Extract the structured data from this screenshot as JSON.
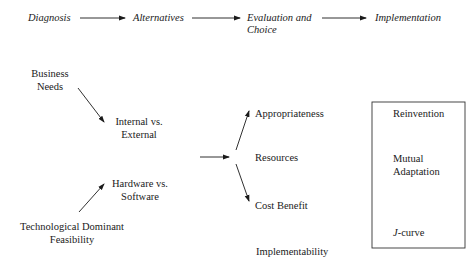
{
  "process_stages": [
    {
      "label": "Diagnosis"
    },
    {
      "label": "Alternatives"
    },
    {
      "label_line1": "Evaluation and",
      "label_line2": "Choice"
    },
    {
      "label": "Implementation"
    }
  ],
  "alternatives": {
    "business_needs": {
      "line1": "Business",
      "line2": "Needs"
    },
    "internal_external": {
      "line1": "Internal vs.",
      "line2": "External"
    },
    "hardware_software": {
      "line1": "Hardware vs.",
      "line2": "Software"
    },
    "tech_feasibility": {
      "line1": "Technological Dominant",
      "line2": "Feasibility"
    }
  },
  "evaluation_criteria": {
    "appropriateness": "Appropriateness",
    "resources": "Resources",
    "cost_benefit": "Cost Benefit",
    "implementability": "Implementability"
  },
  "implementation_box": {
    "reinvention": "Reinvention",
    "mutual_line1": "Mutual",
    "mutual_line2": "Adaptation",
    "jcurve_j": "J",
    "jcurve_rest": "-curve"
  }
}
